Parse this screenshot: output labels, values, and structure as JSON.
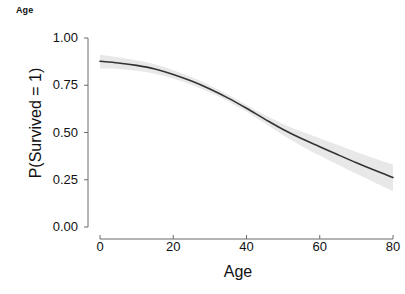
{
  "chart_data": {
    "type": "line",
    "title": "Age",
    "xlabel": "Age",
    "ylabel": "P(Survived = 1)",
    "xlim": [
      0,
      80
    ],
    "ylim": [
      0.0,
      1.0
    ],
    "xticks": [
      0,
      20,
      40,
      60,
      80
    ],
    "xticklabels": [
      "0",
      "20",
      "40",
      "60",
      "80"
    ],
    "yticks": [
      0.0,
      0.25,
      0.5,
      0.75,
      1.0
    ],
    "yticklabels": [
      "0.00",
      "0.25",
      "0.50",
      "0.75",
      "1.00"
    ],
    "grid": false,
    "legend": "none",
    "line_color": "#333333",
    "band_color": "#e8e8e8",
    "background": "#ffffff",
    "series": [
      {
        "name": "P(Survived = 1)",
        "x": [
          0,
          5,
          10,
          15,
          20,
          25,
          30,
          35,
          40,
          45,
          50,
          55,
          60,
          65,
          70,
          75,
          80
        ],
        "values": [
          0.877,
          0.868,
          0.855,
          0.836,
          0.807,
          0.772,
          0.73,
          0.682,
          0.628,
          0.571,
          0.516,
          0.468,
          0.425,
          0.382,
          0.34,
          0.3,
          0.262
        ],
        "ci_lower": [
          0.838,
          0.836,
          0.827,
          0.811,
          0.786,
          0.752,
          0.711,
          0.664,
          0.61,
          0.549,
          0.486,
          0.429,
          0.378,
          0.329,
          0.282,
          0.236,
          0.19
        ],
        "ci_upper": [
          0.911,
          0.898,
          0.882,
          0.861,
          0.829,
          0.793,
          0.749,
          0.7,
          0.646,
          0.592,
          0.545,
          0.505,
          0.47,
          0.434,
          0.397,
          0.362,
          0.33
        ]
      }
    ]
  },
  "labels": {
    "strip": "Age",
    "x_title": "Age",
    "y_title": "P(Survived = 1)"
  }
}
